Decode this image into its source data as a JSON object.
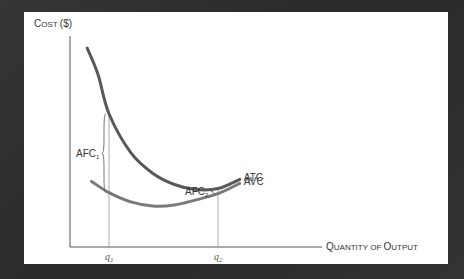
{
  "chart_data": {
    "type": "line",
    "title": "",
    "ylabel": "Cost ($)",
    "xlabel": "Quantity of output",
    "grid": false,
    "x_ticks": [
      {
        "label": "q",
        "sub": "1",
        "x": 2
      },
      {
        "label": "q",
        "sub": "2",
        "x": 7
      }
    ],
    "xlim": [
      0,
      14
    ],
    "ylim": [
      0,
      10
    ],
    "series": [
      {
        "name": "ATC",
        "color": "#585858",
        "points": [
          [
            1,
            9.7
          ],
          [
            1.5,
            8.4
          ],
          [
            2,
            6.5
          ],
          [
            3,
            4.6
          ],
          [
            4,
            3.6
          ],
          [
            5,
            3.05
          ],
          [
            6,
            2.8
          ],
          [
            7,
            2.85
          ],
          [
            8,
            3.3
          ]
        ]
      },
      {
        "name": "AVC",
        "color": "#7a7a7a",
        "points": [
          [
            1.2,
            3.2
          ],
          [
            2,
            2.65
          ],
          [
            3,
            2.2
          ],
          [
            4,
            2.0
          ],
          [
            5,
            2.05
          ],
          [
            6,
            2.3
          ],
          [
            7,
            2.6
          ],
          [
            8,
            3.1
          ]
        ]
      }
    ],
    "annotations": [
      {
        "text": "AFC",
        "sub": "1",
        "type": "brace",
        "x": 2,
        "from_series": "AVC",
        "to_series": "ATC"
      },
      {
        "text": "AFC",
        "sub": "2",
        "type": "brace",
        "x": 7,
        "from_series": "AVC",
        "to_series": "ATC"
      }
    ],
    "vertical_guides": [
      2,
      7
    ],
    "legend": "inline-right"
  }
}
